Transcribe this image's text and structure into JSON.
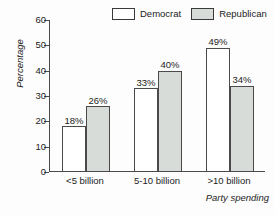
{
  "chart_data": {
    "type": "bar",
    "title": "",
    "xlabel": "Party spending",
    "ylabel": "Percentage",
    "categories": [
      "<5 billion",
      "5-10 billion",
      ">10 billion"
    ],
    "series": [
      {
        "name": "Democrat",
        "values": [
          18,
          33,
          49
        ],
        "labels": [
          "18%",
          "33%",
          "49%"
        ],
        "color": "#ffffff"
      },
      {
        "name": "Republican",
        "values": [
          26,
          40,
          34
        ],
        "labels": [
          "26%",
          "40%",
          "34%"
        ],
        "color": "#d7dcd9"
      }
    ],
    "ylim": [
      0,
      60
    ],
    "yticks": [
      0,
      10,
      20,
      30,
      40,
      50,
      60
    ],
    "ytick_labels": [
      "0",
      "10",
      "20",
      "30",
      "40",
      "50",
      "60"
    ],
    "grid": false,
    "legend_position": "top-center",
    "bar_border_color": "#4a4a4a",
    "axis_color": "#4a4a4a",
    "text_color": "#1c1c1c",
    "background": "#fdfdfd"
  },
  "legend": {
    "entries": [
      {
        "label": "Democrat"
      },
      {
        "label": "Republican"
      }
    ]
  }
}
